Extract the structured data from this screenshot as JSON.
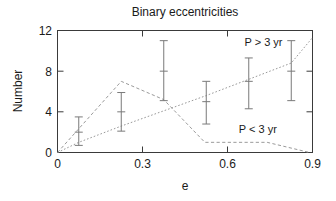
{
  "chart_data": {
    "type": "line",
    "title": "Binary eccentricities",
    "xlabel": "e",
    "ylabel": "Number",
    "xlim": [
      0,
      0.9
    ],
    "ylim": [
      0,
      12
    ],
    "xticks": [
      0,
      0.3,
      0.6,
      0.9
    ],
    "xtick_labels": [
      "0",
      "0.3",
      "0.6",
      "0.9"
    ],
    "yticks": [
      0,
      4,
      8,
      12
    ],
    "ytick_labels": [
      "0",
      "4",
      "8",
      "12"
    ],
    "grid": false,
    "legend_position": "inline-annotations",
    "series": [
      {
        "name": "P > 3 yr",
        "style": "dotted",
        "label": "P > 3 yr",
        "label_x": 0.66,
        "label_y": 10.5,
        "x": [
          0.0,
          0.075,
          0.225,
          0.375,
          0.525,
          0.675,
          0.825,
          0.9
        ],
        "values": [
          0.0,
          1.0,
          2.6,
          4.1,
          5.6,
          7.2,
          8.8,
          11.3
        ],
        "points": [
          {
            "x": 0.075,
            "y": 2.0,
            "yerr_low": 0.7,
            "yerr_high": 3.5
          },
          {
            "x": 0.225,
            "y": 4.0,
            "yerr_low": 2.1,
            "yerr_high": 5.9
          },
          {
            "x": 0.375,
            "y": 8.0,
            "yerr_low": 5.1,
            "yerr_high": 11.0
          },
          {
            "x": 0.525,
            "y": 5.0,
            "yerr_low": 2.8,
            "yerr_high": 7.0
          },
          {
            "x": 0.675,
            "y": 7.0,
            "yerr_low": 4.3,
            "yerr_high": 9.3
          },
          {
            "x": 0.825,
            "y": 8.0,
            "yerr_low": 5.1,
            "yerr_high": 11.0
          }
        ]
      },
      {
        "name": "P < 3 yr",
        "style": "dashed",
        "label": "P < 3 yr",
        "label_x": 0.64,
        "label_y": 1.9,
        "x": [
          0.0,
          0.225,
          0.375,
          0.52,
          0.74,
          0.89
        ],
        "values": [
          0.0,
          7.0,
          5.2,
          1.0,
          1.0,
          0.0
        ]
      }
    ]
  },
  "annotations": {
    "title": "Binary eccentricities",
    "xlabel": "e",
    "ylabel": "Number",
    "series_long_label": "P > 3 yr",
    "series_short_label": "P < 3 yr"
  }
}
